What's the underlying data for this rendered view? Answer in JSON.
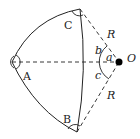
{
  "diagram": {
    "type": "spherical-triangle",
    "vertices": {
      "A": {
        "label": "A"
      },
      "B": {
        "label": "B"
      },
      "C": {
        "label": "C"
      }
    },
    "center": {
      "label": "O"
    },
    "radius_labels": [
      "R",
      "R"
    ],
    "side_angle_labels": {
      "a": "a",
      "b": "b",
      "c": "c"
    },
    "colors": {
      "line": "#222222",
      "dot": "#000000",
      "background": "#ffffff"
    }
  }
}
